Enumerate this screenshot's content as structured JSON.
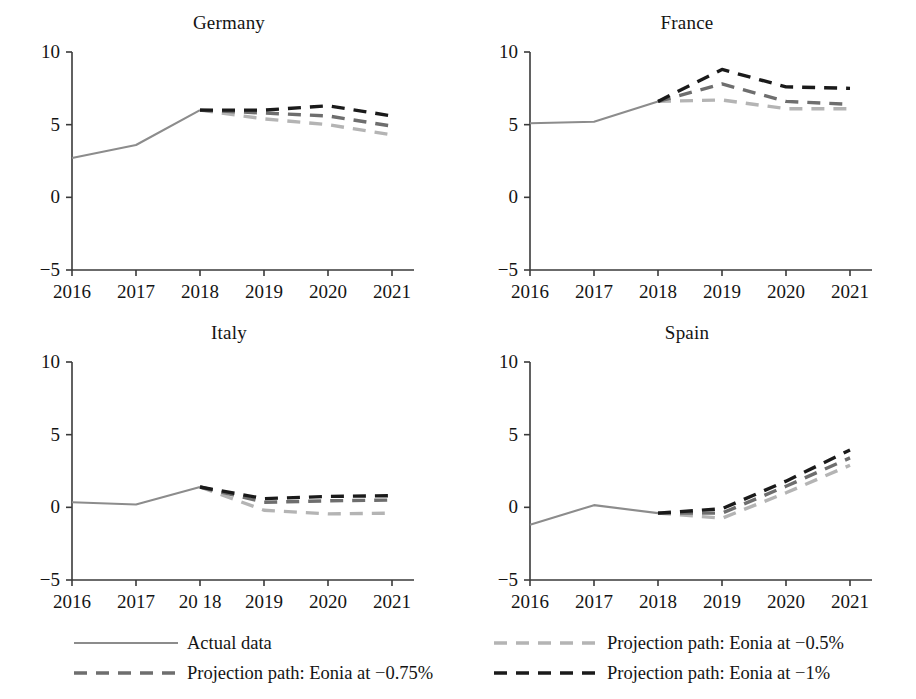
{
  "figure": {
    "width": 916,
    "height": 699,
    "background": "#ffffff"
  },
  "axis": {
    "y_ticks": [
      "10",
      "5",
      "0",
      "−5"
    ],
    "y_values": [
      10,
      5,
      0,
      -5
    ],
    "x_ticks": [
      "2016",
      "2017",
      "2018",
      "2019",
      "2020",
      "2021"
    ],
    "x_ticks_italy": [
      "2016",
      "2017",
      "20 18",
      "2019",
      "2020",
      "2021"
    ],
    "ylim": [
      -5,
      10
    ],
    "xlim": [
      2016,
      2021
    ]
  },
  "colors": {
    "actual": "#8c8c8c",
    "eonia_050": "#b4b4b4",
    "eonia_075": "#6e6e6e",
    "eonia_100": "#1a1a1a",
    "axis": "#3a3a3a",
    "text": "#141414"
  },
  "legend": {
    "left": [
      {
        "label": "Actual data",
        "style": "solid",
        "color": "#8c8c8c",
        "key": "actual-data-key"
      },
      {
        "label": "Projection path: Eonia at −0.75%",
        "style": "dashed",
        "color": "#6e6e6e",
        "key": "eonia-075-key"
      }
    ],
    "right": [
      {
        "label": "Projection path: Eonia at −0.5%",
        "style": "dashed",
        "color": "#b4b4b4",
        "key": "eonia-050-key"
      },
      {
        "label": "Projection path: Eonia at −1%",
        "style": "dashed",
        "color": "#1a1a1a",
        "key": "eonia-100-key"
      }
    ]
  },
  "chart_data": {
    "type": "line",
    "title": "",
    "xlabel": "",
    "ylabel": "",
    "ylim": [
      -5,
      10
    ],
    "grid": false,
    "legend_position": "bottom",
    "x": [
      2016,
      2017,
      2018,
      2019,
      2020,
      2021
    ],
    "panels": [
      {
        "name": "Germany",
        "title": "Germany",
        "series": [
          {
            "name": "Actual data",
            "style": "solid",
            "color": "#8c8c8c",
            "x": [
              2016,
              2017,
              2018
            ],
            "values": [
              2.7,
              3.6,
              6.0
            ]
          },
          {
            "name": "Projection path: Eonia at −0.5%",
            "style": "dashed",
            "color": "#b4b4b4",
            "x": [
              2018,
              2019,
              2020,
              2021
            ],
            "values": [
              6.0,
              5.4,
              5.0,
              4.3
            ]
          },
          {
            "name": "Projection path: Eonia at −0.75%",
            "style": "dashed",
            "color": "#6e6e6e",
            "x": [
              2018,
              2019,
              2020,
              2021
            ],
            "values": [
              6.0,
              5.8,
              5.6,
              4.9
            ]
          },
          {
            "name": "Projection path: Eonia at −1%",
            "style": "dashed",
            "color": "#1a1a1a",
            "x": [
              2018,
              2019,
              2020,
              2021
            ],
            "values": [
              6.0,
              6.0,
              6.3,
              5.6
            ]
          }
        ]
      },
      {
        "name": "France",
        "title": "France",
        "series": [
          {
            "name": "Actual data",
            "style": "solid",
            "color": "#8c8c8c",
            "x": [
              2016,
              2017,
              2018
            ],
            "values": [
              5.1,
              5.2,
              6.6
            ]
          },
          {
            "name": "Projection path: Eonia at −0.5%",
            "style": "dashed",
            "color": "#b4b4b4",
            "x": [
              2018,
              2019,
              2020,
              2021
            ],
            "values": [
              6.6,
              6.7,
              6.1,
              6.1
            ]
          },
          {
            "name": "Projection path: Eonia at −0.75%",
            "style": "dashed",
            "color": "#6e6e6e",
            "x": [
              2018,
              2019,
              2020,
              2021
            ],
            "values": [
              6.6,
              7.8,
              6.6,
              6.4
            ]
          },
          {
            "name": "Projection path: Eonia at −1%",
            "style": "dashed",
            "color": "#1a1a1a",
            "x": [
              2018,
              2019,
              2020,
              2021
            ],
            "values": [
              6.6,
              8.8,
              7.6,
              7.5
            ]
          }
        ]
      },
      {
        "name": "Italy",
        "title": "Italy",
        "series": [
          {
            "name": "Actual data",
            "style": "solid",
            "color": "#8c8c8c",
            "x": [
              2016,
              2017,
              2018
            ],
            "values": [
              0.35,
              0.2,
              1.4
            ]
          },
          {
            "name": "Projection path: Eonia at −0.5%",
            "style": "dashed",
            "color": "#b4b4b4",
            "x": [
              2018,
              2019,
              2020,
              2021
            ],
            "values": [
              1.4,
              -0.2,
              -0.45,
              -0.4
            ]
          },
          {
            "name": "Projection path: Eonia at −0.75%",
            "style": "dashed",
            "color": "#6e6e6e",
            "x": [
              2018,
              2019,
              2020,
              2021
            ],
            "values": [
              1.4,
              0.35,
              0.45,
              0.5
            ]
          },
          {
            "name": "Projection path: Eonia at −1%",
            "style": "dashed",
            "color": "#1a1a1a",
            "x": [
              2018,
              2019,
              2020,
              2021
            ],
            "values": [
              1.4,
              0.6,
              0.75,
              0.8
            ]
          }
        ]
      },
      {
        "name": "Spain",
        "title": "Spain",
        "series": [
          {
            "name": "Actual data",
            "style": "solid",
            "color": "#8c8c8c",
            "x": [
              2016,
              2017,
              2018
            ],
            "values": [
              -1.2,
              0.15,
              -0.4
            ]
          },
          {
            "name": "Projection path: Eonia at −0.5%",
            "style": "dashed",
            "color": "#b4b4b4",
            "x": [
              2018,
              2019,
              2020,
              2021
            ],
            "values": [
              -0.4,
              -0.75,
              1.0,
              2.9
            ]
          },
          {
            "name": "Projection path: Eonia at −0.75%",
            "style": "dashed",
            "color": "#6e6e6e",
            "x": [
              2018,
              2019,
              2020,
              2021
            ],
            "values": [
              -0.4,
              -0.4,
              1.45,
              3.4
            ]
          },
          {
            "name": "Projection path: Eonia at −1%",
            "style": "dashed",
            "color": "#1a1a1a",
            "x": [
              2018,
              2019,
              2020,
              2021
            ],
            "values": [
              -0.4,
              -0.1,
              1.8,
              3.95
            ]
          }
        ]
      }
    ]
  }
}
